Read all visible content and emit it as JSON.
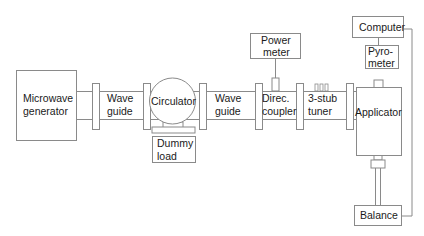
{
  "diagram": {
    "type": "block-diagram",
    "colors": {
      "stroke": "#8a8a8a",
      "text": "#1a1a1a",
      "background": "#ffffff"
    },
    "components": {
      "microwave_generator": {
        "line1": "Microwave",
        "line2": "generator"
      },
      "waveguide_1": {
        "line1": "Wave",
        "line2": "guide"
      },
      "circulator": {
        "label": "Circulator"
      },
      "dummy_load": {
        "line1": "Dummy",
        "line2": "load"
      },
      "waveguide_2": {
        "line1": "Wave",
        "line2": "guide"
      },
      "directional_coupler": {
        "line1": "Direc.",
        "line2": "coupler"
      },
      "power_meter": {
        "line1": "Power",
        "line2": "meter"
      },
      "stub_tuner": {
        "line1": "3-stub",
        "line2": "tuner"
      },
      "applicator": {
        "label": "Applicator"
      },
      "computer": {
        "label": "Computer"
      },
      "pyrometer": {
        "line1": "Pyro-",
        "line2": "meter"
      },
      "balance": {
        "label": "Balance"
      }
    },
    "connections": [
      [
        "Microwave generator",
        "Wave guide"
      ],
      [
        "Wave guide",
        "Circulator"
      ],
      [
        "Circulator",
        "Dummy load"
      ],
      [
        "Circulator",
        "Wave guide"
      ],
      [
        "Wave guide",
        "Direc. coupler"
      ],
      [
        "Direc. coupler",
        "Power meter"
      ],
      [
        "Direc. coupler",
        "3-stub tuner"
      ],
      [
        "3-stub tuner",
        "Applicator"
      ],
      [
        "Applicator",
        "Balance"
      ],
      [
        "Computer",
        "Pyrometer"
      ],
      [
        "Computer",
        "Balance"
      ]
    ]
  }
}
